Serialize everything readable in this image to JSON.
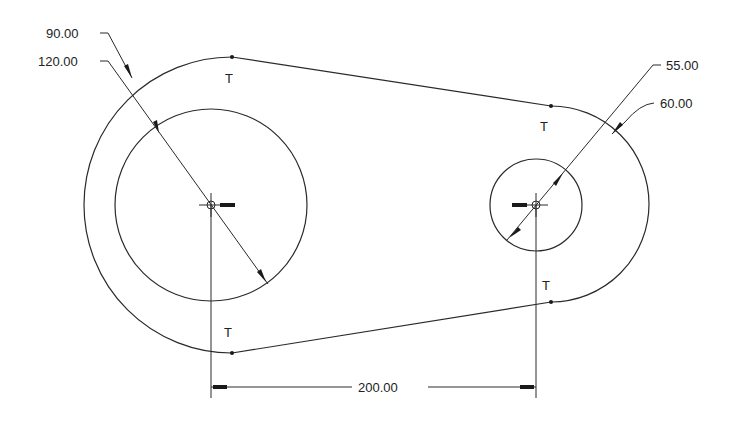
{
  "drawing": {
    "type": "2D sketch - link with two bosses",
    "colors": {
      "line": "#2a2a2a",
      "background": "#ffffff"
    },
    "left_boss": {
      "center": [
        211,
        205
      ],
      "outer_diameter_label": "90.00",
      "inner_diameter_label": "120.00"
    },
    "right_boss": {
      "center": [
        536,
        205
      ],
      "inner_diameter_label": "55.00",
      "outer_diameter_label": "60.00"
    },
    "center_distance_label": "200.00",
    "tangent_marker": "T",
    "tangent_markers": [
      {
        "id": "top-left",
        "label": "T"
      },
      {
        "id": "top-right",
        "label": "T"
      },
      {
        "id": "bottom-left",
        "label": "T"
      },
      {
        "id": "bottom-right",
        "label": "T"
      }
    ]
  }
}
